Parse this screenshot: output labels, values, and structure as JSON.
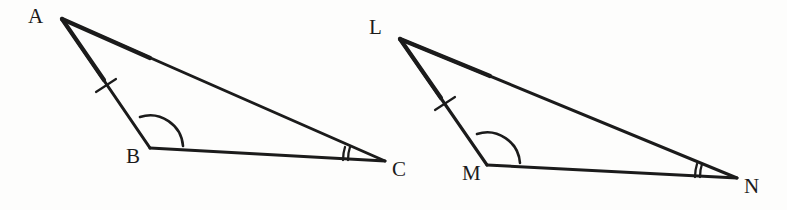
{
  "figure": {
    "background_color": "#fdfdfc",
    "stroke_color": "#1b1b1b",
    "label_color": "#1b1b1b",
    "width": 787,
    "height": 210
  },
  "triangles": [
    {
      "name": "triangle-abc",
      "vertices": [
        {
          "label": "A",
          "x": 62,
          "y": 19,
          "label_x": 28,
          "label_y": 6
        },
        {
          "label": "B",
          "x": 150,
          "y": 148,
          "label_x": 126,
          "label_y": 146
        },
        {
          "label": "C",
          "x": 385,
          "y": 161,
          "label_x": 392,
          "label_y": 159
        }
      ],
      "sides": [
        {
          "name": "side-ab",
          "from": "A",
          "to": "B",
          "tick_marks": 1
        },
        {
          "name": "side-bc",
          "from": "B",
          "to": "C",
          "tick_marks": 0
        },
        {
          "name": "side-ac",
          "from": "A",
          "to": "C",
          "tick_marks": 0
        }
      ],
      "angles": [
        {
          "name": "angle-b",
          "at": "B",
          "arcs": 1
        },
        {
          "name": "angle-c",
          "at": "C",
          "arcs": 2
        }
      ]
    },
    {
      "name": "triangle-lmn",
      "vertices": [
        {
          "label": "L",
          "x": 400,
          "y": 39,
          "label_x": 369,
          "label_y": 17
        },
        {
          "label": "M",
          "x": 487,
          "y": 165,
          "label_x": 462,
          "label_y": 163
        },
        {
          "label": "N",
          "x": 737,
          "y": 178,
          "label_x": 744,
          "label_y": 176
        }
      ],
      "sides": [
        {
          "name": "side-lm",
          "from": "L",
          "to": "M",
          "tick_marks": 1
        },
        {
          "name": "side-mn",
          "from": "M",
          "to": "N",
          "tick_marks": 0
        },
        {
          "name": "side-ln",
          "from": "L",
          "to": "N",
          "tick_marks": 0
        }
      ],
      "angles": [
        {
          "name": "angle-m",
          "at": "M",
          "arcs": 1
        },
        {
          "name": "angle-n",
          "at": "N",
          "arcs": 2
        }
      ]
    }
  ],
  "labels": {
    "a": "A",
    "b": "B",
    "c": "C",
    "l": "L",
    "m": "M",
    "n": "N"
  }
}
